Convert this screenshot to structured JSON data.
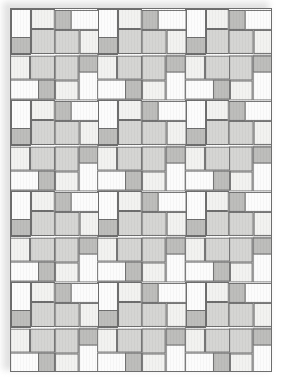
{
  "figure": {
    "kind": "quilt-pattern-diagram",
    "title": "",
    "canvas": {
      "width": 282,
      "height": 382
    },
    "quilt": {
      "x": 10,
      "y": 8,
      "width": 262,
      "height": 364
    }
  },
  "layout": {
    "block_columns": 3,
    "block_rows": 4,
    "block_width": 86.67,
    "block_height": 90.5,
    "quadrants_per_block": 4,
    "strips_per_quadrant": 4,
    "rotation_sequence_deg": [
      0,
      90,
      180,
      270
    ]
  },
  "colors": {
    "outline": "#6e6e6e",
    "background": "#ffffff",
    "quilt_background": "#fbfbfb",
    "shadow": "#d8d8d8",
    "fabric_light_1": "#fcfcfc",
    "fabric_light_2": "#f2f2f0",
    "fabric_medium_1": "#d5d5d3",
    "fabric_medium_2": "#bdbdbb"
  },
  "fabrics": [
    {
      "key": "f-l1",
      "name": "light-1",
      "hex": "#fcfcfc"
    },
    {
      "key": "f-l2",
      "name": "light-2",
      "hex": "#f2f2f0"
    },
    {
      "key": "f-m1",
      "name": "medium-1",
      "hex": "#d5d5d3"
    },
    {
      "key": "f-m2",
      "name": "medium-2",
      "hex": "#bdbdbb"
    }
  ],
  "quadrant_strips": [
    {
      "index": 0,
      "fabric": "f-l1",
      "x": 0,
      "y": 0,
      "w": 0.5,
      "h": 1.0
    },
    {
      "index": 1,
      "fabric": "f-l2",
      "x": 0.5,
      "y": 0,
      "w": 0.5,
      "h": 0.5
    },
    {
      "index": 2,
      "fabric": "f-m1",
      "x": 0.5,
      "y": 0.5,
      "w": 0.5,
      "h": 0.5
    },
    {
      "index": 3,
      "fabric": "f-m2",
      "x": 0.25,
      "y": 0.75,
      "w": 0.25,
      "h": 0.25
    }
  ]
}
